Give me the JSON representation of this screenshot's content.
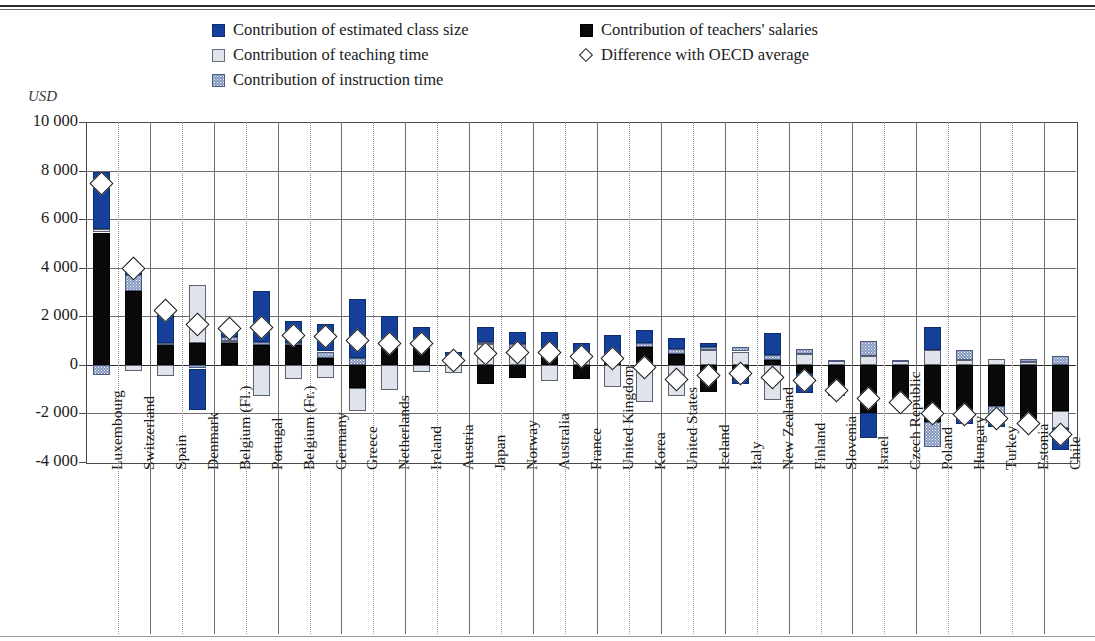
{
  "axis": {
    "unit_label": "USD",
    "yticks": [
      "10 000",
      "8 000",
      "6 000",
      "4 000",
      "2 000",
      "0",
      "-2 000",
      "-4 000"
    ],
    "ymin": -4000,
    "ymax": 10000,
    "ystep": 2000
  },
  "legend": {
    "items": [
      {
        "key": "class_size",
        "label": "Contribution of estimated class size",
        "swatch": "square-blue",
        "color": "#15409a"
      },
      {
        "key": "teaching",
        "label": "Contribution of teaching time",
        "swatch": "square-light-grey",
        "color": "#dfe4ec"
      },
      {
        "key": "instruction",
        "label": "Contribution of instruction time",
        "swatch": "square-dotted-blue",
        "color": "#8296bf"
      },
      {
        "key": "salaries",
        "label": "Contribution of teachers' salaries",
        "swatch": "square-black",
        "color": "#0a0a0a"
      },
      {
        "key": "difference",
        "label": "Difference with OECD average",
        "swatch": "diamond-outline",
        "color": "#ffffff"
      }
    ]
  },
  "chart_data": {
    "type": "bar",
    "title": "",
    "subtitle": "",
    "xlabel": "",
    "ylabel": "USD",
    "ylim": [
      -4000,
      10000
    ],
    "grid": true,
    "legend_position": "top",
    "stacked": true,
    "series_names": [
      "Contribution of estimated class size",
      "Contribution of teaching time",
      "Contribution of instruction time",
      "Contribution of teachers' salaries",
      "Difference with OECD average"
    ],
    "categories": [
      "Luxembourg",
      "Switzerland",
      "Spain",
      "Denmark",
      "Belgium (Fl.)",
      "Portugal",
      "Belgium (Fr.)",
      "Germany",
      "Greece",
      "Netherlands",
      "Ireland",
      "Austria",
      "Japan",
      "Norway",
      "Australia",
      "France",
      "United Kingdom",
      "Korea",
      "United States",
      "Iceland",
      "Italy",
      "New Zealand",
      "Finland",
      "Slovenia",
      "Israel",
      "Czech Republic",
      "Poland",
      "Hungary",
      "Turkey",
      "Estonia",
      "Chile"
    ],
    "points": [
      {
        "country": "Luxembourg",
        "salaries": 5450,
        "teaching": 150,
        "instruction": -400,
        "class_size": 2350,
        "difference": 7450
      },
      {
        "country": "Switzerland",
        "salaries": 3050,
        "teaching": -250,
        "instruction": 650,
        "class_size": 300,
        "difference": 3950
      },
      {
        "country": "Spain",
        "salaries": 850,
        "teaching": -450,
        "instruction": 50,
        "class_size": 1400,
        "difference": 2250
      },
      {
        "country": "Denmark",
        "salaries": 900,
        "teaching": 2400,
        "instruction": -150,
        "class_size": -1700,
        "difference": 1650
      },
      {
        "country": "Belgium (Fl.)",
        "salaries": 900,
        "teaching": 100,
        "instruction": 150,
        "class_size": 400,
        "difference": 1500
      },
      {
        "country": "Portugal",
        "salaries": 800,
        "teaching": -1300,
        "instruction": 150,
        "class_size": 2100,
        "difference": 1550
      },
      {
        "country": "Belgium (Fr.)",
        "salaries": 800,
        "teaching": -600,
        "instruction": 100,
        "class_size": 900,
        "difference": 1200
      },
      {
        "country": "Germany",
        "salaries": 300,
        "teaching": -550,
        "instruction": 250,
        "class_size": 1150,
        "difference": 1150
      },
      {
        "country": "Greece",
        "salaries": -950,
        "teaching": -950,
        "instruction": 300,
        "class_size": 2400,
        "difference": 1000
      },
      {
        "country": "Netherlands",
        "salaries": 900,
        "teaching": -1050,
        "instruction": 150,
        "class_size": 950,
        "difference": 900
      },
      {
        "country": "Ireland",
        "salaries": 750,
        "teaching": -300,
        "instruction": 150,
        "class_size": 650,
        "difference": 900
      },
      {
        "country": "Austria",
        "salaries": 300,
        "teaching": -350,
        "instruction": 100,
        "class_size": 150,
        "difference": 200
      },
      {
        "country": "Japan",
        "salaries": -800,
        "teaching": 850,
        "instruction": 100,
        "class_size": 600,
        "difference": 450
      },
      {
        "country": "Norway",
        "salaries": -550,
        "teaching": 600,
        "instruction": 250,
        "class_size": 500,
        "difference": 500
      },
      {
        "country": "Australia",
        "salaries": 400,
        "teaching": -650,
        "instruction": 250,
        "class_size": 700,
        "difference": 500
      },
      {
        "country": "France",
        "salaries": -600,
        "teaching": 250,
        "instruction": 150,
        "class_size": 500,
        "difference": 350
      },
      {
        "country": "United Kingdom",
        "salaries": 200,
        "teaching": -900,
        "instruction": 150,
        "class_size": 900,
        "difference": 250
      },
      {
        "country": "Korea",
        "salaries": 750,
        "teaching": -1550,
        "instruction": 150,
        "class_size": 550,
        "difference": -100
      },
      {
        "country": "United States",
        "salaries": 450,
        "teaching": -1300,
        "instruction": 200,
        "class_size": 450,
        "difference": -600
      },
      {
        "country": "Iceland",
        "salaries": -1100,
        "teaching": 600,
        "instruction": 150,
        "class_size": 150,
        "difference": -450
      },
      {
        "country": "Italy",
        "salaries": -600,
        "teaching": 550,
        "instruction": 200,
        "class_size": -200,
        "difference": -350
      },
      {
        "country": "New Zealand",
        "salaries": 200,
        "teaching": -1450,
        "instruction": 200,
        "class_size": 900,
        "difference": -500
      },
      {
        "country": "Finland",
        "salaries": -350,
        "teaching": 450,
        "instruction": 200,
        "class_size": -800,
        "difference": -650
      },
      {
        "country": "Slovenia",
        "salaries": -1200,
        "teaching": 150,
        "instruction": 50,
        "class_size": -50,
        "difference": -1050
      },
      {
        "country": "Israel",
        "salaries": -2000,
        "teaching": 350,
        "instruction": 650,
        "class_size": -1000,
        "difference": -1400
      },
      {
        "country": "Czech Republic",
        "salaries": -1600,
        "teaching": 150,
        "instruction": 50,
        "class_size": -50,
        "difference": -1550
      },
      {
        "country": "Poland",
        "salaries": -2350,
        "teaching": 600,
        "instruction": -1050,
        "class_size": 950,
        "difference": -2000
      },
      {
        "country": "Hungary",
        "salaries": -2150,
        "teaching": 200,
        "instruction": 400,
        "class_size": -300,
        "difference": -2050
      },
      {
        "country": "Turkey",
        "salaries": -1700,
        "teaching": 250,
        "instruction": -750,
        "class_size": -50,
        "difference": -2200
      },
      {
        "country": "Estonia",
        "salaries": -2450,
        "teaching": 100,
        "instruction": 150,
        "class_size": -50,
        "difference": -2400
      },
      {
        "country": "Chile",
        "salaries": -1900,
        "teaching": -700,
        "instruction": 350,
        "class_size": -900,
        "difference": -2850
      }
    ]
  }
}
